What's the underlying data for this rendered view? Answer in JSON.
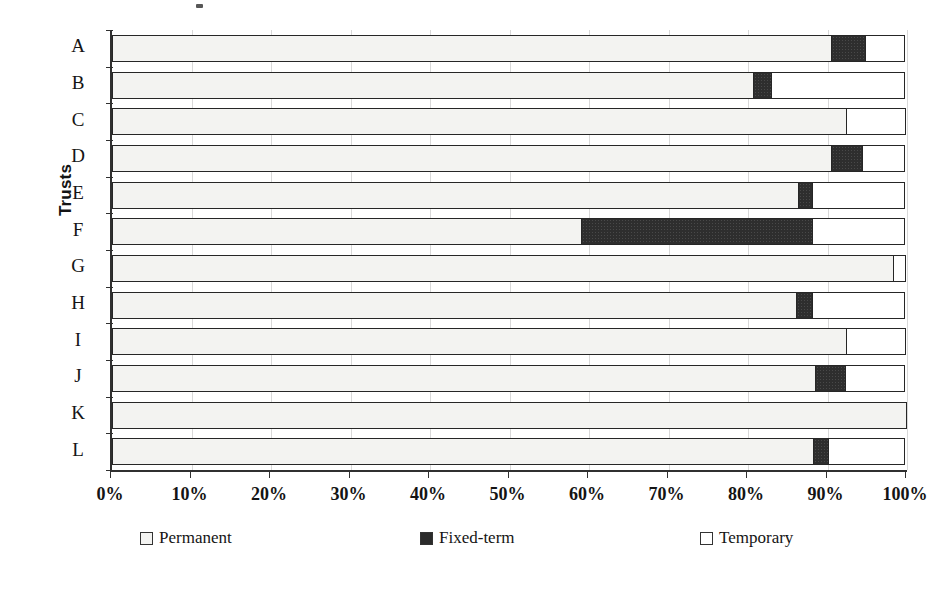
{
  "chart_data": {
    "type": "bar",
    "orientation": "horizontal",
    "stacked": true,
    "normalized": true,
    "title": "",
    "xlabel": "",
    "ylabel": "Trusts",
    "xlim": [
      0,
      100
    ],
    "grid": true,
    "legend_position": "bottom",
    "categories": [
      "A",
      "B",
      "C",
      "D",
      "E",
      "F",
      "G",
      "H",
      "I",
      "J",
      "K",
      "L"
    ],
    "tick_labels": [
      "0%",
      "10%",
      "20%",
      "30%",
      "40%",
      "50%",
      "60%",
      "70%",
      "80%",
      "90%",
      "100%"
    ],
    "tick_values": [
      0,
      10,
      20,
      30,
      40,
      50,
      60,
      70,
      80,
      90,
      100
    ],
    "series": [
      {
        "name": "Permanent",
        "color": "#f3f3f1",
        "values": [
          90.6,
          80.8,
          92.5,
          90.6,
          86.4,
          59.1,
          98.4,
          86.2,
          92.5,
          88.5,
          100.0,
          88.3
        ]
      },
      {
        "name": "Fixed-term",
        "color": "#2e2e2e",
        "values": [
          4.4,
          2.3,
          0.0,
          4.0,
          1.9,
          29.2,
          0.0,
          2.1,
          0.0,
          3.9,
          0.0,
          2.0
        ]
      },
      {
        "name": "Temporary",
        "color": "#ffffff",
        "values": [
          5.0,
          16.9,
          7.5,
          5.4,
          11.7,
          11.7,
          1.6,
          11.7,
          7.5,
          7.6,
          0.0,
          9.7
        ]
      }
    ]
  },
  "legend": {
    "items": [
      {
        "label": "Permanent",
        "swatch": "permanent-swatch"
      },
      {
        "label": "Fixed-term",
        "swatch": "fixed-term-swatch"
      },
      {
        "label": "Temporary",
        "swatch": "temporary-swatch"
      }
    ]
  },
  "axis": {
    "y_title": "Trusts"
  }
}
